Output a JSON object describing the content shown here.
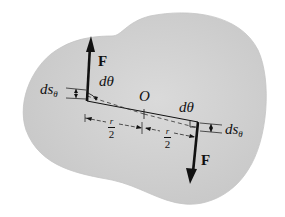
{
  "diagram": {
    "type": "free-body rigid body with force couple",
    "colors": {
      "body_fill": "#d2d2d2",
      "body_edge": "#c4c4c4",
      "ink": "#111111",
      "background": "#ffffff"
    },
    "labels": {
      "force_top": "F",
      "force_bottom": "F",
      "center": "O",
      "angle_left": "dθ",
      "angle_right": "dθ",
      "disp_left_main": "ds",
      "disp_left_sub": "θ",
      "disp_right_main": "ds",
      "disp_right_sub": "θ",
      "half_r_left_num": "r",
      "half_r_left_den": "2",
      "half_r_right_num": "r",
      "half_r_right_den": "2"
    }
  }
}
